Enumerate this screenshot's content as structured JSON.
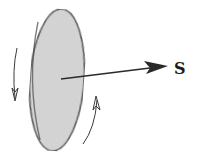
{
  "diagram": {
    "type": "spinning-disk-with-angular-momentum-vector",
    "vector_label": "S",
    "rotation_direction": "counterclockwise-arrows",
    "colors": {
      "disk_fill": "#d6d6d6",
      "disk_edge": "#3a3a3a",
      "vector": "#2a2a2a",
      "rotation_arrows": "#3a3a3a",
      "label": "#1a1a1a",
      "background": "#ffffff"
    },
    "elements": [
      {
        "name": "disk",
        "shape": "ellipse",
        "cx": 57,
        "cy": 80,
        "rx": 28,
        "ry": 71
      },
      {
        "name": "spin-vector",
        "shape": "arrow",
        "from": [
          61,
          79
        ],
        "to": [
          167,
          66
        ]
      },
      {
        "name": "rotation-arrow-left",
        "shape": "curved-arrow",
        "direction": "down"
      },
      {
        "name": "rotation-arrow-right",
        "shape": "curved-arrow",
        "direction": "up"
      }
    ]
  }
}
